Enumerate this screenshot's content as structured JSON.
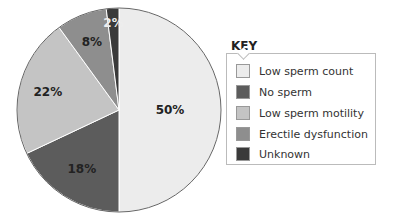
{
  "chart_data": {
    "type": "pie",
    "title": "",
    "legend_title": "KEY",
    "legend_position": "right",
    "categories": [
      "Low sperm count",
      "No sperm",
      "Low sperm motility",
      "Erectile dysfunction",
      "Unknown"
    ],
    "values": [
      50,
      18,
      22,
      8,
      2
    ],
    "labels": [
      "50%",
      "18%",
      "22%",
      "8%",
      "2%"
    ],
    "colors": [
      "#ececec",
      "#5c5c5c",
      "#c4c4c4",
      "#8e8e8e",
      "#3a3a3a"
    ]
  },
  "legend": {
    "title": "KEY",
    "items": [
      {
        "label": "Low sperm count",
        "color": "#ececec"
      },
      {
        "label": "No sperm",
        "color": "#5c5c5c"
      },
      {
        "label": "Low sperm motility",
        "color": "#c4c4c4"
      },
      {
        "label": "Erectile dysfunction",
        "color": "#8e8e8e"
      },
      {
        "label": "Unknown",
        "color": "#3a3a3a"
      }
    ]
  }
}
